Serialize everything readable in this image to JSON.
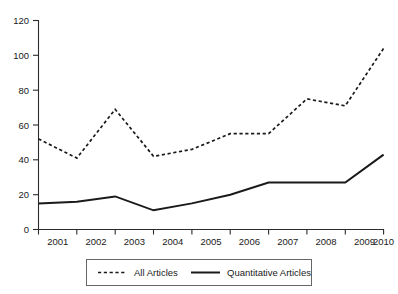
{
  "chart_data": {
    "type": "line",
    "title": "",
    "xlabel": "",
    "ylabel": "",
    "categories": [
      "2001",
      "2002",
      "2003",
      "2004",
      "2005",
      "2006",
      "2007",
      "2008",
      "2009",
      "2010"
    ],
    "x": [
      2001,
      2002,
      2003,
      2004,
      2005,
      2006,
      2007,
      2008,
      2009,
      2010
    ],
    "series": [
      {
        "name": "All Articles",
        "style": "dashed",
        "color": "#1a1a1a",
        "values": [
          52,
          41,
          69,
          42,
          46,
          55,
          55,
          75,
          71,
          104
        ]
      },
      {
        "name": "Quantitative Articles",
        "style": "solid",
        "color": "#1a1a1a",
        "values": [
          15,
          16,
          19,
          11,
          15,
          20,
          27,
          27,
          27,
          43
        ]
      }
    ],
    "ylim": [
      0,
      120
    ],
    "ytick_labels": [
      "0",
      "20",
      "40",
      "60",
      "80",
      "100",
      "120"
    ],
    "ytick_values": [
      0,
      20,
      40,
      60,
      80,
      100,
      120
    ],
    "grid": false,
    "legend_position": "bottom",
    "legend_entries": [
      {
        "label": "All Articles",
        "style": "dashed"
      },
      {
        "label": "Quantitative Articles",
        "style": "solid"
      }
    ]
  },
  "axes": {
    "y_label_120": "120",
    "y_label_100": "100",
    "y_label_80": "80",
    "y_label_60": "60",
    "y_label_40": "40",
    "y_label_20": "20",
    "y_label_0": "0",
    "x_label_2001": "2001",
    "x_label_2002": "2002",
    "x_label_2003": "2003",
    "x_label_2004": "2004",
    "x_label_2005": "2005",
    "x_label_2006": "2006",
    "x_label_2007": "2007",
    "x_label_2008": "2008",
    "x_label_2009": "2009",
    "x_label_2010": "2010"
  },
  "legend": {
    "all_articles": "All Articles",
    "quantitative_articles": "Quantitative Articles"
  },
  "colors": {
    "line": "#1a1a1a",
    "axis": "#2b2b2b",
    "legend_border": "#666666",
    "background": "#ffffff"
  }
}
